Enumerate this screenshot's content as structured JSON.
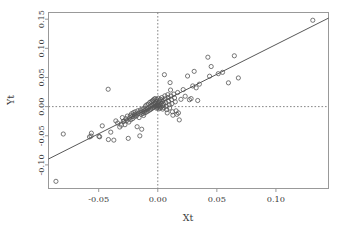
{
  "chart_data": {
    "type": "scatter",
    "title": "",
    "xlabel": "Xt",
    "ylabel": "Yt",
    "xlim": [
      -0.0925,
      0.1445
    ],
    "ylim": [
      -0.1405,
      0.1615
    ],
    "xticks": [
      -0.05,
      0.0,
      0.05,
      0.1
    ],
    "xticklabels": [
      "-0.05",
      "0.00",
      "0.05",
      "0.10"
    ],
    "yticks": [
      -0.1,
      -0.05,
      0.0,
      0.05,
      0.1,
      0.15
    ],
    "yticklabels": [
      "-0.10",
      "-0.05",
      "0.00",
      "0.05",
      "0.10",
      "0.15"
    ],
    "grid": false,
    "legend": null,
    "marker": {
      "shape": "open-circle",
      "radius": 2.1,
      "color": "#555555"
    },
    "reference_lines": [
      {
        "name": "vertical-zero-line",
        "axis": "x",
        "value": 0.0,
        "style": "dashed",
        "color": "#777777"
      },
      {
        "name": "horizontal-zero-line",
        "axis": "y",
        "value": 0.0,
        "style": "dashed",
        "color": "#777777"
      }
    ],
    "fit_line": {
      "name": "regression-line",
      "style": "solid",
      "color": "#444444",
      "slope": 1.02,
      "intercept": 0.0045,
      "x_start": -0.0925,
      "x_end": 0.1445
    },
    "points": [
      [
        -0.0862,
        -0.1282
      ],
      [
        -0.08,
        -0.047
      ],
      [
        -0.0578,
        -0.052
      ],
      [
        -0.0565,
        -0.0505
      ],
      [
        -0.0562,
        -0.0455
      ],
      [
        -0.0498,
        -0.051
      ],
      [
        -0.0492,
        -0.0518
      ],
      [
        -0.047,
        -0.033
      ],
      [
        -0.042,
        0.0298
      ],
      [
        -0.0418,
        -0.0565
      ],
      [
        -0.0398,
        -0.0438
      ],
      [
        -0.0372,
        -0.0575
      ],
      [
        -0.0355,
        -0.0245
      ],
      [
        -0.034,
        -0.0282
      ],
      [
        -0.0322,
        -0.035
      ],
      [
        -0.0308,
        -0.0318
      ],
      [
        -0.03,
        -0.0188
      ],
      [
        -0.0292,
        -0.0252
      ],
      [
        -0.0285,
        -0.0248
      ],
      [
        -0.0278,
        -0.031
      ],
      [
        -0.027,
        -0.0208
      ],
      [
        -0.0262,
        -0.0238
      ],
      [
        -0.0258,
        -0.0162
      ],
      [
        -0.025,
        -0.0545
      ],
      [
        -0.0245,
        -0.0265
      ],
      [
        -0.0238,
        -0.0192
      ],
      [
        -0.0232,
        -0.0152
      ],
      [
        -0.0228,
        -0.0225
      ],
      [
        -0.0222,
        -0.0122
      ],
      [
        -0.0218,
        -0.0168
      ],
      [
        -0.0212,
        -0.0205
      ],
      [
        -0.0205,
        -0.0102
      ],
      [
        -0.02,
        -0.0142
      ],
      [
        -0.0196,
        -0.0175
      ],
      [
        -0.019,
        -0.0088
      ],
      [
        -0.0185,
        -0.0128
      ],
      [
        -0.018,
        -0.0158
      ],
      [
        -0.0175,
        -0.0345
      ],
      [
        -0.017,
        -0.0072
      ],
      [
        -0.0165,
        -0.0115
      ],
      [
        -0.0158,
        -0.0188
      ],
      [
        -0.0152,
        -0.0502
      ],
      [
        -0.0148,
        -0.0058
      ],
      [
        -0.0145,
        -0.0098
      ],
      [
        -0.014,
        -0.0132
      ],
      [
        -0.0136,
        -0.0388
      ],
      [
        -0.0132,
        -0.0042
      ],
      [
        -0.0128,
        -0.0082
      ],
      [
        -0.0124,
        -0.0118
      ],
      [
        -0.012,
        -0.0152
      ],
      [
        -0.0116,
        -0.0028
      ],
      [
        -0.0112,
        -0.0068
      ],
      [
        -0.0108,
        -0.0105
      ],
      [
        -0.0104,
        0.0012
      ],
      [
        -0.01,
        -0.0052
      ],
      [
        -0.0096,
        -0.0092
      ],
      [
        -0.0092,
        0.0032
      ],
      [
        -0.0088,
        -0.0038
      ],
      [
        -0.0084,
        -0.0078
      ],
      [
        -0.008,
        0.0042
      ],
      [
        -0.0076,
        -0.0022
      ],
      [
        -0.0072,
        -0.0062
      ],
      [
        -0.0068,
        0.0072
      ],
      [
        -0.0064,
        0.0005
      ],
      [
        -0.006,
        -0.0048
      ],
      [
        -0.0056,
        0.0085
      ],
      [
        -0.0052,
        0.0018
      ],
      [
        -0.005,
        -0.0032
      ],
      [
        -0.0046,
        0.0098
      ],
      [
        -0.0044,
        0.0028
      ],
      [
        -0.004,
        -0.0018
      ],
      [
        -0.0038,
        0.0112
      ],
      [
        -0.0036,
        0.0042
      ],
      [
        -0.0032,
        -0.0008
      ],
      [
        -0.003,
        0.0128
      ],
      [
        -0.0028,
        0.0052
      ],
      [
        -0.0024,
        0.0002
      ],
      [
        -0.0022,
        0.0138
      ],
      [
        -0.002,
        0.0062
      ],
      [
        -0.0018,
        0.0012
      ],
      [
        -0.0015,
        0.0088
      ],
      [
        -0.0012,
        0.0022
      ],
      [
        -0.001,
        -0.0028
      ],
      [
        -0.0008,
        0.0118
      ],
      [
        -0.0005,
        0.0035
      ],
      [
        -0.0002,
        -0.0015
      ],
      [
        0.0,
        0.0058
      ],
      [
        0.0002,
        0.0005
      ],
      [
        0.0004,
        0.0145
      ],
      [
        0.0006,
        0.0072
      ],
      [
        0.0008,
        0.0018
      ],
      [
        0.001,
        -0.0038
      ],
      [
        0.0014,
        0.0098
      ],
      [
        0.0018,
        0.0032
      ],
      [
        0.002,
        -0.0022
      ],
      [
        0.0024,
        0.0125
      ],
      [
        0.0028,
        0.0055
      ],
      [
        0.003,
        -0.0008
      ],
      [
        0.0034,
        0.0155
      ],
      [
        0.0038,
        0.0085
      ],
      [
        0.004,
        0.0018
      ],
      [
        0.0042,
        -0.0042
      ],
      [
        0.0046,
        0.0112
      ],
      [
        0.005,
        0.0042
      ],
      [
        0.0052,
        -0.0018
      ],
      [
        0.0056,
        0.0548
      ],
      [
        0.006,
        0.0185
      ],
      [
        0.0064,
        0.0135
      ],
      [
        0.0068,
        0.0068
      ],
      [
        0.0072,
        0.0008
      ],
      [
        0.0076,
        -0.0052
      ],
      [
        0.008,
        -0.0108
      ],
      [
        0.0084,
        0.0205
      ],
      [
        0.0088,
        0.0158
      ],
      [
        0.0092,
        0.0092
      ],
      [
        0.0096,
        0.0032
      ],
      [
        0.01,
        -0.0025
      ],
      [
        0.0104,
        0.0412
      ],
      [
        0.0108,
        0.0285
      ],
      [
        0.0112,
        0.0182
      ],
      [
        0.0116,
        0.0118
      ],
      [
        0.012,
        0.0052
      ],
      [
        0.0124,
        -0.0088
      ],
      [
        0.0128,
        -0.0148
      ],
      [
        0.0136,
        0.0215
      ],
      [
        0.0142,
        0.0148
      ],
      [
        0.0148,
        0.0082
      ],
      [
        0.0155,
        -0.0072
      ],
      [
        0.0162,
        -0.0132
      ],
      [
        0.0168,
        0.0242
      ],
      [
        0.0175,
        -0.0108
      ],
      [
        0.0182,
        -0.0228
      ],
      [
        0.0196,
        0.0125
      ],
      [
        0.0215,
        0.0292
      ],
      [
        0.0232,
        0.0178
      ],
      [
        0.0252,
        0.0525
      ],
      [
        0.0268,
        0.0118
      ],
      [
        0.0282,
        0.0138
      ],
      [
        0.0296,
        0.0355
      ],
      [
        0.0308,
        0.0605
      ],
      [
        0.0325,
        0.0322
      ],
      [
        0.0338,
        0.0105
      ],
      [
        0.0352,
        0.0385
      ],
      [
        0.0424,
        0.0848
      ],
      [
        0.0438,
        0.0522
      ],
      [
        0.0452,
        0.0688
      ],
      [
        0.0512,
        0.0565
      ],
      [
        0.0548,
        0.0588
      ],
      [
        0.0598,
        0.0408
      ],
      [
        0.0648,
        0.0872
      ],
      [
        0.0682,
        0.0492
      ],
      [
        0.1312,
        0.1482
      ]
    ]
  },
  "axes": {
    "x_axis_name": "x-axis",
    "y_axis_name": "y-axis"
  }
}
